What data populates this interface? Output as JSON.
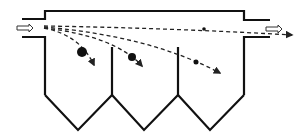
{
  "diagram": {
    "type": "gravity-settling-chamber",
    "colors": {
      "wall": "#111111",
      "trajectory": "#222222",
      "flow_arrow_fill": "#ffffff",
      "flow_arrow_stroke": "#333333",
      "background": "#ffffff"
    },
    "inlet_arrow": {
      "label": ""
    },
    "outlet_arrow": {
      "label": ""
    },
    "hoppers": [
      {
        "id": "hopper-1"
      },
      {
        "id": "hopper-2"
      },
      {
        "id": "hopper-3"
      }
    ],
    "particles": [
      {
        "size": "large",
        "radius": 5
      },
      {
        "size": "medium",
        "radius": 4
      },
      {
        "size": "small",
        "radius": 2.5
      },
      {
        "size": "fine",
        "radius": 1.8
      }
    ]
  }
}
